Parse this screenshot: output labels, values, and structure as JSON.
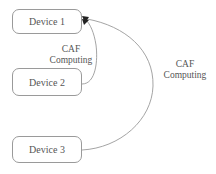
{
  "nodes": [
    {
      "id": "device1",
      "label": "Device 1"
    },
    {
      "id": "device2",
      "label": "Device 2"
    },
    {
      "id": "device3",
      "label": "Device 3"
    }
  ],
  "edges": [
    {
      "from": "device2",
      "to": "device1",
      "label_line1": "CAF",
      "label_line2": "Computing"
    },
    {
      "from": "device3",
      "to": "device1",
      "label_line1": "CAF",
      "label_line2": "Computing"
    }
  ],
  "colors": {
    "stroke": "#9a9a9a",
    "text": "#555555",
    "arrow": "#222222"
  }
}
